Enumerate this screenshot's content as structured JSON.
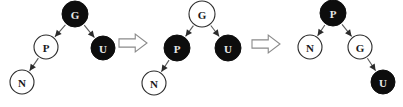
{
  "figure": {
    "width": 403,
    "height": 107,
    "background": "#ffffff",
    "colors": {
      "filled_node": "#0d0d0d",
      "hollow_node": "#ffffff",
      "node_outline": "#2b2b2b",
      "edge": "#5a5a5a",
      "arrow_outline": "#8a8a8a",
      "label_on_dark": "#e8e8e8",
      "label_on_light": "#1a1a1a"
    },
    "steps": [
      {
        "id": "step-1",
        "nodes": [
          {
            "id": "g",
            "label": "G",
            "fill": "filled",
            "cx": 75,
            "cy": 14,
            "r": 13
          },
          {
            "id": "p",
            "label": "P",
            "fill": "hollow",
            "cx": 46,
            "cy": 47,
            "r": 12
          },
          {
            "id": "u",
            "label": "U",
            "fill": "filled",
            "cx": 103,
            "cy": 48,
            "r": 12
          },
          {
            "id": "n",
            "label": "N",
            "fill": "hollow",
            "cx": 22,
            "cy": 82,
            "r": 12
          }
        ],
        "edges": [
          {
            "from": "g",
            "to": "p"
          },
          {
            "from": "g",
            "to": "u"
          },
          {
            "from": "p",
            "to": "n"
          }
        ]
      },
      {
        "id": "step-2",
        "nodes": [
          {
            "id": "g",
            "label": "G",
            "fill": "hollow",
            "cx": 202,
            "cy": 14,
            "r": 13
          },
          {
            "id": "p",
            "label": "P",
            "fill": "filled",
            "cx": 177,
            "cy": 48,
            "r": 13
          },
          {
            "id": "u",
            "label": "U",
            "fill": "filled",
            "cx": 228,
            "cy": 48,
            "r": 13
          },
          {
            "id": "n",
            "label": "N",
            "fill": "hollow",
            "cx": 154,
            "cy": 83,
            "r": 12
          }
        ],
        "edges": [
          {
            "from": "g",
            "to": "p"
          },
          {
            "from": "g",
            "to": "u"
          },
          {
            "from": "p",
            "to": "n"
          }
        ]
      },
      {
        "id": "step-3",
        "nodes": [
          {
            "id": "p",
            "label": "P",
            "fill": "filled",
            "cx": 333,
            "cy": 13,
            "r": 13
          },
          {
            "id": "n",
            "label": "N",
            "fill": "hollow",
            "cx": 310,
            "cy": 47,
            "r": 12
          },
          {
            "id": "g",
            "label": "G",
            "fill": "hollow",
            "cx": 360,
            "cy": 47,
            "r": 12
          },
          {
            "id": "u",
            "label": "U",
            "fill": "filled",
            "cx": 383,
            "cy": 82,
            "r": 12
          }
        ],
        "edges": [
          {
            "from": "p",
            "to": "n"
          },
          {
            "from": "p",
            "to": "g"
          },
          {
            "from": "g",
            "to": "u"
          }
        ]
      }
    ],
    "transitions": [
      {
        "id": "transition-1",
        "glyph": "block-arrow-right",
        "x": 119,
        "y": 34,
        "width": 28,
        "height": 18
      },
      {
        "id": "transition-2",
        "glyph": "block-arrow-right",
        "x": 252,
        "y": 35,
        "width": 28,
        "height": 18
      }
    ]
  }
}
